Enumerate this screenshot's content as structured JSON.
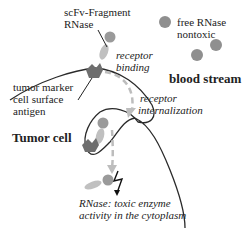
{
  "labels": {
    "scfv_line1": "scFv-Fragment",
    "scfv_line2": "RNase",
    "free_line1": "free RNase",
    "free_line2": "nontoxic",
    "receptor_binding_1": "receptor",
    "receptor_binding_2": "binding",
    "blood_stream": "blood stream",
    "tumor_marker_1": "tumor marker",
    "tumor_marker_2": "cell surface",
    "tumor_marker_3": "antigen",
    "receptor_intern_1": "receptor",
    "receptor_intern_2": "internalization",
    "tumor_cell": "Tumor cell",
    "toxic_1": "RNase: toxic enzyme",
    "toxic_2": "activity in the cytoplasm"
  },
  "colors": {
    "rnase": "#8f8f8f",
    "scfv": "#b5b5b5",
    "antigen": "#6e6e6e",
    "membrane": "#2a2a2a",
    "arrow": "#bdbdbd"
  },
  "icons": [
    "rnase-sphere-icon",
    "scfv-fragment-icon",
    "antigen-receptor-icon",
    "lightning-bolt-icon",
    "dashed-arrow-icon"
  ]
}
